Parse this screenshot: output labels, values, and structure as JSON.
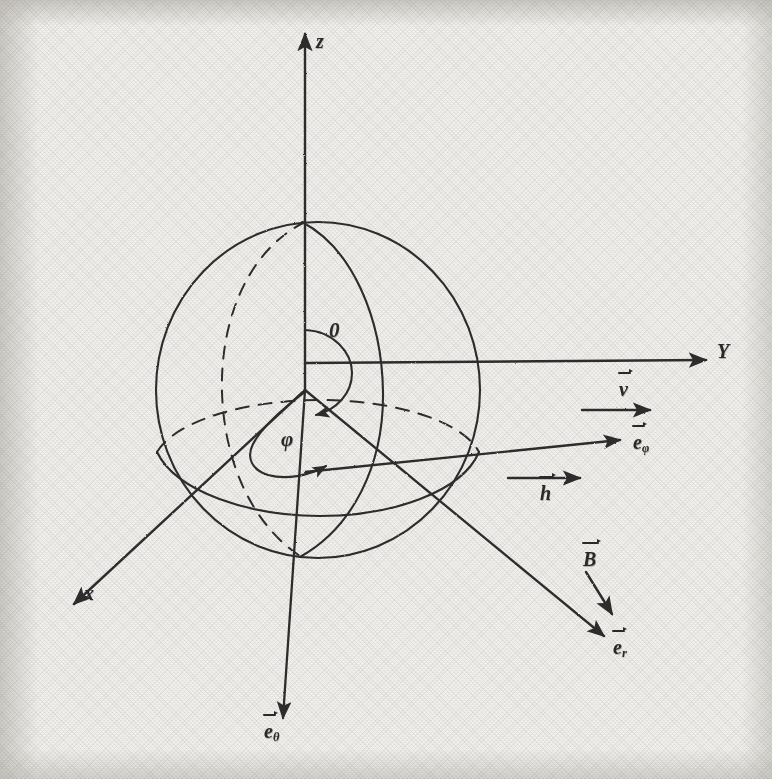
{
  "figure": {
    "domain": "Diagram",
    "kind": "spherical-coordinate-system",
    "background_color": "#f2f1ee",
    "ink_color": "#2b2b2b",
    "media": "scanned photocopy, monochrome line drawing"
  },
  "axes": [
    {
      "id": "z",
      "label": "z",
      "direction": "up",
      "label_x": 316,
      "label_y": 30
    },
    {
      "id": "y",
      "label": "Y",
      "direction": "right",
      "label_x": 717,
      "label_y": 352
    },
    {
      "id": "x",
      "label": "x",
      "direction": "lower-left",
      "label_x": 84,
      "label_y": 592
    }
  ],
  "point_labels": [
    {
      "id": "origin",
      "label": "0",
      "x": 329,
      "y": 329
    },
    {
      "id": "phi-angle",
      "label": "φ",
      "x": 281,
      "y": 438
    }
  ],
  "vectors": [
    {
      "id": "v",
      "label": "v",
      "sub": "",
      "overbar": true,
      "label_x": 619,
      "label_y": 390
    },
    {
      "id": "e-phi",
      "label": "e",
      "sub": "φ",
      "overbar": true,
      "label_x": 633,
      "label_y": 443
    },
    {
      "id": "h",
      "label": "h",
      "sub": "",
      "overbar": true,
      "label_x": 540,
      "label_y": 494
    },
    {
      "id": "B",
      "label": "B",
      "sub": "",
      "overbar": true,
      "label_x": 583,
      "label_y": 585
    },
    {
      "id": "e-r",
      "label": "e",
      "sub": "r",
      "overbar": true,
      "label_x": 613,
      "label_y": 648
    },
    {
      "id": "e-theta",
      "label": "e",
      "sub": "θ",
      "overbar": true,
      "label_x": 264,
      "label_y": 732
    }
  ],
  "geometry": {
    "sphere_center": {
      "x": 318,
      "y": 390
    },
    "sphere_radius_x": 162,
    "sphere_radius_y": 168,
    "equator_dashed": true,
    "meridian_dashed_back": true,
    "description": "Unit sphere centred at the origin with a dashed back-equator, a solid front-equator ellipse, a dashed back meridian and a solid tilted meridian through the radial direction."
  }
}
